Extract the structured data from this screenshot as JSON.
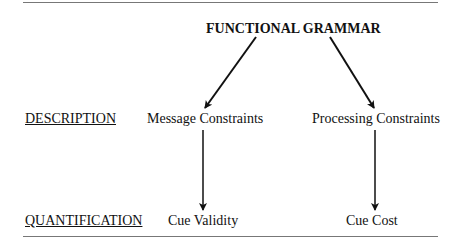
{
  "diagram": {
    "title": "FUNCTIONAL GRAMMAR",
    "rows": [
      {
        "label": "DESCRIPTION",
        "left": "Message Constraints",
        "right": "Processing Constraints"
      },
      {
        "label": "QUANTIFICATION",
        "left": "Cue Validity",
        "right": "Cue Cost"
      }
    ],
    "edges": [
      {
        "from": "FUNCTIONAL GRAMMAR",
        "to": "Message Constraints"
      },
      {
        "from": "FUNCTIONAL GRAMMAR",
        "to": "Processing Constraints"
      },
      {
        "from": "Message Constraints",
        "to": "Cue Validity"
      },
      {
        "from": "Processing Constraints",
        "to": "Cue Cost"
      }
    ]
  }
}
